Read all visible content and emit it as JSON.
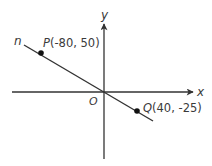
{
  "diagram": {
    "type": "coordinate-plane",
    "axes": {
      "x_label": "x",
      "y_label": "y",
      "origin_label": "O"
    },
    "line": {
      "name": "n",
      "color": "#333333"
    },
    "points": [
      {
        "name": "P",
        "coords": "(-80, 50)",
        "x": -80,
        "y": 50
      },
      {
        "name": "Q",
        "coords": "(40, -25)",
        "x": 40,
        "y": -25
      }
    ],
    "colors": {
      "axis": "#333333",
      "text": "#3a3a3a",
      "point": "#111111"
    }
  }
}
